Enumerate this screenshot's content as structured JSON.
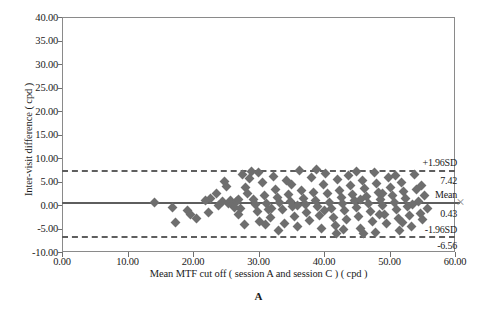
{
  "figure": {
    "panel_label": "A"
  },
  "chart_data": {
    "type": "scatter",
    "subtype": "bland-altman",
    "title": "",
    "xlabel": "Mean MTF cut off ( session A and session C ) ( cpd )",
    "ylabel": "Inter-visit difference ( cpd )",
    "xlim": [
      0,
      60
    ],
    "ylim": [
      -10,
      40
    ],
    "grid": false,
    "legend": "none",
    "xticks": [
      "0.00",
      "10.00",
      "20.00",
      "30.00",
      "40.00",
      "50.00",
      "60.00"
    ],
    "xtick_values": [
      0,
      10,
      20,
      30,
      40,
      50,
      60
    ],
    "yticks": [
      "-10.00",
      "-5.00",
      "0.00",
      "5.00",
      "10.00",
      "15.00",
      "20.00",
      "25.00",
      "30.00",
      "35.00",
      "40.00"
    ],
    "ytick_values": [
      -10,
      -5,
      0,
      5,
      10,
      15,
      20,
      25,
      30,
      35,
      40
    ],
    "reference_lines": [
      {
        "name": "upper-limit-of-agreement",
        "label": "+1.96SD",
        "value_label": "7.42",
        "value": 7.42,
        "style": "dashed"
      },
      {
        "name": "mean-bias",
        "label": "Mean",
        "value_label": "0.43",
        "value": 0.43,
        "style": "solid"
      },
      {
        "name": "lower-limit-of-agreement",
        "label": "-1.96SD",
        "value_label": "-6.56",
        "value": -6.56,
        "style": "dashed"
      }
    ],
    "marker": {
      "shape": "diamond",
      "color": "#6e6e6e",
      "size": 7
    },
    "points": [
      [
        14.1,
        0.45
      ],
      [
        16.9,
        -0.55
      ],
      [
        17.4,
        -3.75
      ],
      [
        19.1,
        -1.25
      ],
      [
        19.6,
        -2.05
      ],
      [
        20.6,
        -2.95
      ],
      [
        22.7,
        1.45
      ],
      [
        23.6,
        2.55
      ],
      [
        23.9,
        -0.15
      ],
      [
        24.5,
        0.65
      ],
      [
        25.1,
        3.85
      ],
      [
        25.4,
        0.25
      ],
      [
        25.7,
        1.05
      ],
      [
        26.0,
        0.05
      ],
      [
        26.3,
        -0.45
      ],
      [
        26.6,
        0.85
      ],
      [
        26.9,
        1.25
      ],
      [
        27.0,
        -2.05
      ],
      [
        27.6,
        6.55
      ],
      [
        27.9,
        -4.15
      ],
      [
        28.3,
        2.35
      ],
      [
        28.6,
        5.65
      ],
      [
        28.9,
        7.05
      ],
      [
        29.2,
        1.15
      ],
      [
        29.6,
        0.05
      ],
      [
        29.8,
        -1.35
      ],
      [
        30.2,
        -3.55
      ],
      [
        30.6,
        4.85
      ],
      [
        30.9,
        2.05
      ],
      [
        31.2,
        0.25
      ],
      [
        31.5,
        -1.05
      ],
      [
        31.9,
        -2.75
      ],
      [
        32.3,
        6.15
      ],
      [
        32.6,
        3.35
      ],
      [
        32.9,
        1.55
      ],
      [
        33.2,
        0.45
      ],
      [
        33.6,
        -0.95
      ],
      [
        33.9,
        -3.95
      ],
      [
        34.3,
        5.15
      ],
      [
        34.6,
        2.25
      ],
      [
        34.9,
        0.75
      ],
      [
        35.2,
        -0.25
      ],
      [
        35.5,
        -2.35
      ],
      [
        35.9,
        -4.65
      ],
      [
        36.2,
        7.25
      ],
      [
        36.5,
        3.05
      ],
      [
        36.8,
        1.35
      ],
      [
        37.1,
        0.15
      ],
      [
        37.4,
        -1.55
      ],
      [
        37.8,
        -3.25
      ],
      [
        38.1,
        5.95
      ],
      [
        38.4,
        2.75
      ],
      [
        38.7,
        1.05
      ],
      [
        39.0,
        -0.35
      ],
      [
        39.3,
        -2.15
      ],
      [
        39.6,
        -5.05
      ],
      [
        39.9,
        4.35
      ],
      [
        40.2,
        6.75
      ],
      [
        40.5,
        2.45
      ],
      [
        40.8,
        0.55
      ],
      [
        41.1,
        -0.85
      ],
      [
        41.4,
        -2.65
      ],
      [
        41.7,
        -4.35
      ],
      [
        42.0,
        5.45
      ],
      [
        42.3,
        3.15
      ],
      [
        42.6,
        1.65
      ],
      [
        42.9,
        0.35
      ],
      [
        43.2,
        -1.15
      ],
      [
        43.5,
        -3.05
      ],
      [
        43.8,
        6.35
      ],
      [
        44.1,
        4.05
      ],
      [
        44.4,
        2.15
      ],
      [
        44.7,
        0.95
      ],
      [
        45.0,
        -0.55
      ],
      [
        45.3,
        -2.45
      ],
      [
        45.6,
        -4.95
      ],
      [
        45.9,
        5.25
      ],
      [
        46.2,
        3.45
      ],
      [
        46.5,
        1.85
      ],
      [
        46.8,
        0.25
      ],
      [
        47.1,
        -1.45
      ],
      [
        47.4,
        -3.45
      ],
      [
        47.7,
        6.95
      ],
      [
        48.0,
        4.55
      ],
      [
        48.3,
        2.65
      ],
      [
        48.6,
        1.15
      ],
      [
        48.9,
        -0.15
      ],
      [
        49.2,
        -1.95
      ],
      [
        49.5,
        -3.85
      ],
      [
        49.8,
        5.75
      ],
      [
        50.1,
        3.65
      ],
      [
        50.4,
        1.95
      ],
      [
        50.7,
        0.45
      ],
      [
        51.0,
        -1.05
      ],
      [
        51.3,
        -2.85
      ],
      [
        51.6,
        -5.35
      ],
      [
        51.9,
        4.75
      ],
      [
        52.2,
        2.95
      ],
      [
        52.5,
        1.45
      ],
      [
        52.8,
        -0.25
      ],
      [
        53.1,
        -2.25
      ],
      [
        53.4,
        -4.55
      ],
      [
        53.8,
        6.45
      ],
      [
        54.1,
        3.25
      ],
      [
        54.4,
        0.85
      ],
      [
        54.7,
        -1.75
      ],
      [
        55.1,
        -3.15
      ],
      [
        55.4,
        2.05
      ],
      [
        55.8,
        -0.65
      ],
      [
        24.8,
        5.05
      ],
      [
        27.3,
        -0.75
      ],
      [
        30.0,
        6.85
      ],
      [
        33.0,
        -5.45
      ],
      [
        36.0,
        -0.05
      ],
      [
        38.9,
        7.45
      ],
      [
        41.9,
        -6.05
      ],
      [
        44.9,
        7.15
      ],
      [
        47.9,
        -5.75
      ],
      [
        50.9,
        6.25
      ],
      [
        21.9,
        0.95
      ],
      [
        22.3,
        -1.65
      ],
      [
        28.0,
        3.75
      ],
      [
        31.0,
        -4.25
      ],
      [
        35.0,
        4.45
      ],
      [
        43.0,
        -5.25
      ],
      [
        46.0,
        -6.15
      ],
      [
        49.0,
        2.35
      ],
      [
        52.0,
        -3.65
      ],
      [
        54.9,
        4.15
      ],
      [
        32.0,
        -0.65
      ],
      [
        40.0,
        -1.25
      ],
      [
        45.5,
        1.25
      ],
      [
        48.5,
        -2.05
      ],
      [
        53.5,
        0.15
      ]
    ]
  }
}
